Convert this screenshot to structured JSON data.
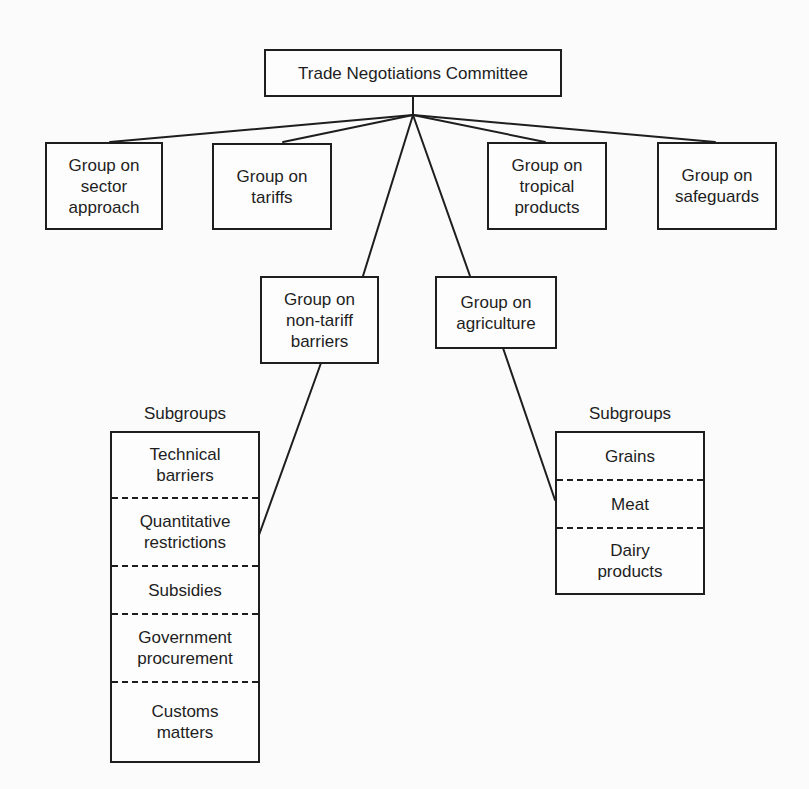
{
  "diagram": {
    "root": {
      "label": "Trade Negotiations Committee"
    },
    "groups": [
      {
        "id": "sector",
        "label": "Group on\nsector\napproach"
      },
      {
        "id": "tariffs",
        "label": "Group on\ntariffs"
      },
      {
        "id": "tropical",
        "label": "Group on\ntropical\nproducts"
      },
      {
        "id": "safeguards",
        "label": "Group on\nsafeguards"
      },
      {
        "id": "non_tariff",
        "label": "Group on\nnon-tariff\nbarriers"
      },
      {
        "id": "agriculture",
        "label": "Group on\nagriculture"
      }
    ],
    "non_tariff_subgroups": {
      "title": "Subgroups",
      "items": [
        "Technical\nbarriers",
        "Quantitative\nrestrictions",
        "Subsidies",
        "Government\nprocurement",
        "Customs\nmatters"
      ]
    },
    "agriculture_subgroups": {
      "title": "Subgroups",
      "items": [
        "Grains",
        "Meat",
        "Dairy\nproducts"
      ]
    },
    "edges": [
      [
        "Trade Negotiations Committee",
        "Group on sector approach"
      ],
      [
        "Trade Negotiations Committee",
        "Group on tariffs"
      ],
      [
        "Trade Negotiations Committee",
        "Group on tropical products"
      ],
      [
        "Trade Negotiations Committee",
        "Group on safeguards"
      ],
      [
        "Trade Negotiations Committee",
        "Group on non-tariff barriers"
      ],
      [
        "Trade Negotiations Committee",
        "Group on agriculture"
      ],
      [
        "Group on non-tariff barriers",
        "Subgroups (non-tariff barriers)"
      ],
      [
        "Group on agriculture",
        "Subgroups (agriculture)"
      ]
    ],
    "colors": {
      "ink": "#1e1e1e",
      "paper": "#fbfbfb"
    }
  }
}
